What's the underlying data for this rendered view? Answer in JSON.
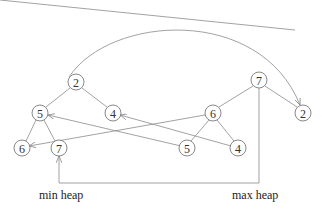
{
  "labels": {
    "min_heap": "min heap",
    "max_heap": "max heap"
  },
  "min_heap": {
    "nodes": [
      {
        "id": "min-2",
        "value": "2",
        "x": 76,
        "y": 82
      },
      {
        "id": "min-5",
        "value": "5",
        "x": 40,
        "y": 113
      },
      {
        "id": "min-4",
        "value": "4",
        "x": 113,
        "y": 113
      },
      {
        "id": "min-6",
        "value": "6",
        "x": 22,
        "y": 148
      },
      {
        "id": "min-7",
        "value": "7",
        "x": 59,
        "y": 148
      }
    ]
  },
  "max_heap": {
    "nodes": [
      {
        "id": "max-7",
        "value": "7",
        "x": 259,
        "y": 80
      },
      {
        "id": "max-6",
        "value": "6",
        "x": 213,
        "y": 113
      },
      {
        "id": "max-2",
        "value": "2",
        "x": 303,
        "y": 113
      },
      {
        "id": "max-5",
        "value": "5",
        "x": 187,
        "y": 148
      },
      {
        "id": "max-4",
        "value": "4",
        "x": 238,
        "y": 148
      }
    ]
  },
  "colors": {
    "edge": "#8a8a8a",
    "node_stroke": "#6a6a6a"
  }
}
